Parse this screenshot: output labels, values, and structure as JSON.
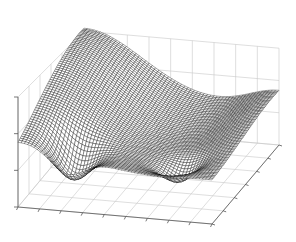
{
  "chart_data": {
    "type": "surface",
    "title": "",
    "xlabel": "",
    "ylabel": "",
    "zlabel": "",
    "render": "mesh",
    "colors": {
      "mesh": "#000000",
      "face": "#ffffff",
      "grid": "#c8c8c8",
      "axis": "#555555",
      "background": "#ffffff"
    },
    "grid": true,
    "tick_labels_visible": false,
    "x_ticks": 9,
    "y_ticks": 6,
    "z_ticks": 3,
    "xlim": [
      0,
      1
    ],
    "ylim": [
      0,
      1
    ],
    "zlim": [
      -0.6,
      1.0
    ],
    "mesh_resolution": 60,
    "features": [
      {
        "name": "peak",
        "x": 0.0,
        "y": 1.0,
        "z": 1.0
      },
      {
        "name": "right-wing",
        "x": 1.0,
        "y": 1.0,
        "z": 0.25
      },
      {
        "name": "left-edge",
        "x": 0.0,
        "y": 0.0,
        "z": 0.0
      },
      {
        "name": "front-trough",
        "x": 0.25,
        "y": 0.15,
        "z": -0.45
      },
      {
        "name": "front-bump",
        "x": 0.75,
        "y": 0.2,
        "z": -0.3
      }
    ]
  }
}
